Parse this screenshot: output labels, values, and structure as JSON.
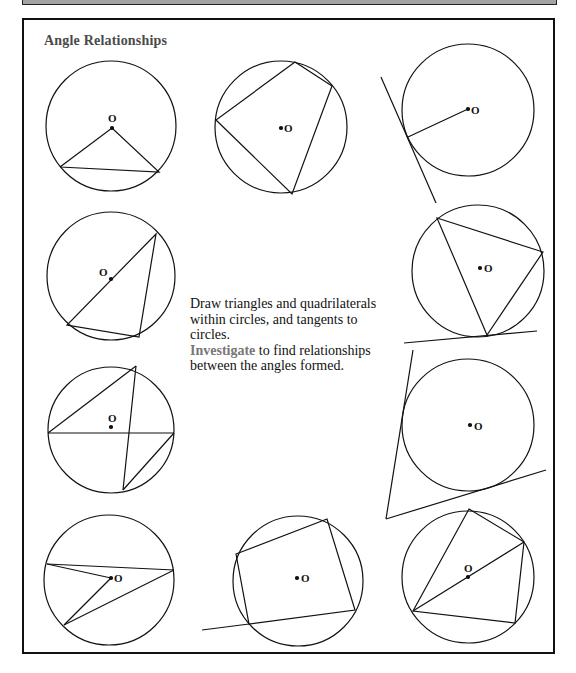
{
  "header": {
    "title": "Angle Relationships"
  },
  "instructions": {
    "line1": "Draw triangles and quadrilaterals",
    "line2": "within circles, and tangents to",
    "line3": "circles.",
    "highlight": "Investigate",
    "line4_rest": " to find relationships",
    "line5": "between the angles formed."
  },
  "center_label": "O",
  "colors": {
    "ink": "#111111",
    "title": "#4a4a4a",
    "highlight": "#777777",
    "top_bar": "#a3a3a3"
  },
  "figures": [
    {
      "name": "isosceles-triangle-center",
      "description": "Triangle with apex at center O and base as chord"
    },
    {
      "name": "cyclic-quadrilateral",
      "description": "Quadrilateral inscribed in circle"
    },
    {
      "name": "tangent-radius",
      "description": "Radius meeting tangent line"
    },
    {
      "name": "triangle-on-diameter",
      "description": "Triangle with one side as diameter"
    },
    {
      "name": "inscribed-triangle-tangent",
      "description": "Inscribed triangle with tangent at vertex"
    },
    {
      "name": "angles-same-segment",
      "description": "Crossing chords with diameter"
    },
    {
      "name": "two-tangents",
      "description": "Two tangents from external point"
    },
    {
      "name": "angle-at-center",
      "description": "Angle at center vs angle at circumference"
    },
    {
      "name": "cyclic-quadrilateral-extended",
      "description": "Cyclic quadrilateral with extended side"
    },
    {
      "name": "quadrilateral-with-diameter",
      "description": "Cyclic quadrilateral with diagonal through center"
    }
  ]
}
